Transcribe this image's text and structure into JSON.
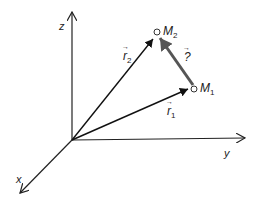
{
  "diagram": {
    "axes": {
      "z_label": "z",
      "y_label": "y",
      "x_label": "x"
    },
    "points": {
      "m1": {
        "label": "M",
        "subscript": "1"
      },
      "m2": {
        "label": "M",
        "subscript": "2"
      }
    },
    "vectors": {
      "r1": {
        "label": "r",
        "subscript": "1",
        "arrow": "→"
      },
      "r2": {
        "label": "r",
        "subscript": "2",
        "arrow": "→"
      },
      "displacement": {
        "label": "?",
        "arrow": "→"
      }
    },
    "colors": {
      "axis": "#222222",
      "vector": "#111111",
      "displacement": "#555555"
    }
  }
}
